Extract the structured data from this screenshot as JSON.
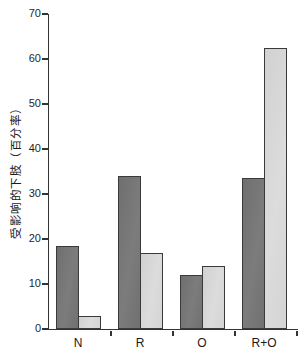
{
  "chart_data": {
    "type": "bar",
    "title": "",
    "xlabel": "",
    "ylabel": "受影响的下肢（百分率）",
    "categories": [
      "N",
      "R",
      "O",
      "R+O"
    ],
    "series": [
      {
        "name": "dark-gray-series",
        "color": "#767676",
        "values": [
          18.5,
          34,
          12,
          33.5
        ]
      },
      {
        "name": "light-gray-series",
        "color": "#d7d7d7",
        "values": [
          3,
          17,
          14,
          62.5
        ]
      }
    ],
    "ylim": [
      0,
      70
    ],
    "yticks": [
      0,
      10,
      20,
      30,
      40,
      50,
      60,
      70
    ],
    "grid": false,
    "legend_position": "none",
    "axis_color": "#333333",
    "bar_border_color": "#3a3a3a"
  }
}
